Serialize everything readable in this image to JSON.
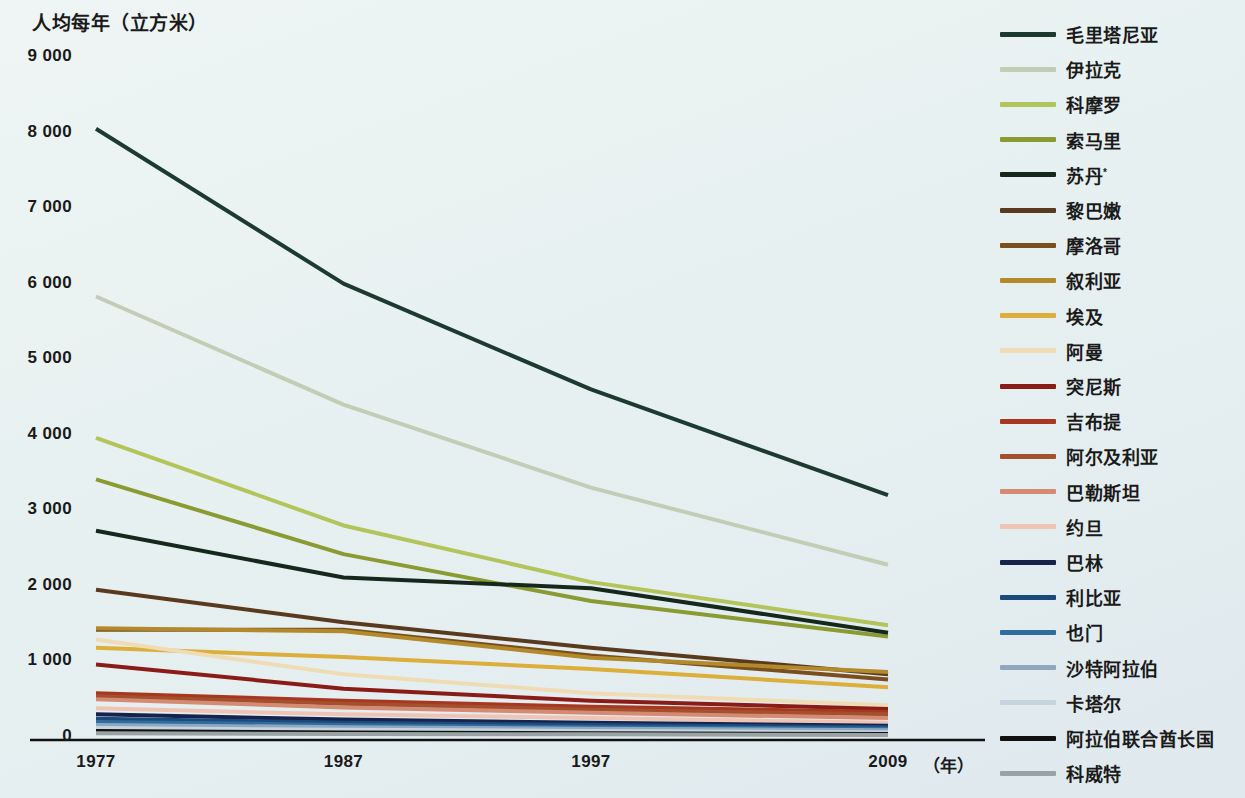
{
  "axis_title": "人均每年（立方米）",
  "x_unit_label": "（年）",
  "y_ticks": [
    "9 000",
    "8 000",
    "7 000",
    "6 000",
    "5 000",
    "4 000",
    "3 000",
    "2 000",
    "1 000",
    "0"
  ],
  "x_ticks": [
    "1977",
    "1987",
    "1997",
    "2009"
  ],
  "colors": {
    "background": "#e8f1f1",
    "axis": "#111111"
  },
  "chart_data": {
    "type": "line",
    "title": "人均每年（立方米）",
    "xlabel": "（年）",
    "ylabel": "人均每年（立方米）",
    "x": [
      1977,
      1987,
      1997,
      2009
    ],
    "xtick_labels": [
      "1977",
      "1987",
      "1997",
      "2009"
    ],
    "ytick_labels": [
      "0",
      "1 000",
      "2 000",
      "3 000",
      "4 000",
      "5 000",
      "6 000",
      "7 000",
      "8 000",
      "9 000"
    ],
    "ylim": [
      0,
      9000
    ],
    "xlim": [
      1977,
      2009
    ],
    "grid": false,
    "legend_position": "right",
    "series": [
      {
        "name": "毛里塔尼亚",
        "color": "#1d3a30",
        "values": [
          8050,
          6000,
          4600,
          3200
        ]
      },
      {
        "name": "伊拉克",
        "color": "#c3cdb6",
        "values": [
          5830,
          4400,
          3300,
          2280
        ]
      },
      {
        "name": "科摩罗",
        "color": "#b2c45a",
        "values": [
          3960,
          2800,
          2050,
          1480
        ]
      },
      {
        "name": "索马里",
        "color": "#8a9b32",
        "values": [
          3410,
          2420,
          1800,
          1330
        ]
      },
      {
        "name": "苏丹*",
        "color": "#16281c",
        "values": [
          2730,
          2110,
          1970,
          1380
        ]
      },
      {
        "name": "黎巴嫩",
        "color": "#5a3a1e",
        "values": [
          1950,
          1520,
          1180,
          830
        ]
      },
      {
        "name": "摩洛哥",
        "color": "#7a4f1d",
        "values": [
          1420,
          1420,
          1080,
          760
        ]
      },
      {
        "name": "叙利亚",
        "color": "#b38a2b",
        "values": [
          1440,
          1400,
          1050,
          860
        ]
      },
      {
        "name": "埃及",
        "color": "#dcae3a",
        "values": [
          1180,
          1060,
          900,
          660
        ]
      },
      {
        "name": "阿曼",
        "color": "#f0dcb4",
        "values": [
          1290,
          830,
          580,
          420
        ]
      },
      {
        "name": "突尼斯",
        "color": "#8a1c18",
        "values": [
          960,
          640,
          480,
          370
        ]
      },
      {
        "name": "吉布提",
        "color": "#a8371f",
        "values": [
          580,
          480,
          400,
          330
        ]
      },
      {
        "name": "阿尔及利亚",
        "color": "#a3502f",
        "values": [
          540,
          440,
          360,
          300
        ]
      },
      {
        "name": "巴勒斯坦",
        "color": "#d58b73",
        "values": [
          500,
          390,
          320,
          250
        ]
      },
      {
        "name": "约旦",
        "color": "#f0c4b4",
        "values": [
          380,
          300,
          250,
          190
        ]
      },
      {
        "name": "巴林",
        "color": "#17234c",
        "values": [
          300,
          230,
          190,
          150
        ]
      },
      {
        "name": "利比亚",
        "color": "#1c4a7a",
        "values": [
          240,
          190,
          160,
          130
        ]
      },
      {
        "name": "也门",
        "color": "#2f6d9e",
        "values": [
          200,
          160,
          130,
          110
        ]
      },
      {
        "name": "沙特阿拉伯",
        "color": "#8fa8c0",
        "values": [
          160,
          130,
          110,
          90
        ]
      },
      {
        "name": "卡塔尔",
        "color": "#c6d4df",
        "values": [
          120,
          95,
          80,
          60
        ]
      },
      {
        "name": "阿拉伯联合酋长国",
        "color": "#111111",
        "values": [
          80,
          60,
          50,
          40
        ]
      },
      {
        "name": "科威特",
        "color": "#9aa3a3",
        "values": [
          50,
          40,
          35,
          25
        ]
      }
    ]
  },
  "legend": {
    "items": [
      {
        "label": "毛里塔尼亚",
        "color": "#1d3a30"
      },
      {
        "label": "伊拉克",
        "color": "#c3cdb6"
      },
      {
        "label": "科摩罗",
        "color": "#b2c45a"
      },
      {
        "label": "索马里",
        "color": "#8a9b32"
      },
      {
        "label": "苏丹*",
        "color": "#16281c"
      },
      {
        "label": "黎巴嫩",
        "color": "#5a3a1e"
      },
      {
        "label": "摩洛哥",
        "color": "#7a4f1d"
      },
      {
        "label": "叙利亚",
        "color": "#b38a2b"
      },
      {
        "label": "埃及",
        "color": "#dcae3a"
      },
      {
        "label": "阿曼",
        "color": "#f0dcb4"
      },
      {
        "label": "突尼斯",
        "color": "#8a1c18"
      },
      {
        "label": "吉布提",
        "color": "#a8371f"
      },
      {
        "label": "阿尔及利亚",
        "color": "#a3502f"
      },
      {
        "label": "巴勒斯坦",
        "color": "#d58b73"
      },
      {
        "label": "约旦",
        "color": "#f0c4b4"
      },
      {
        "label": "巴林",
        "color": "#17234c"
      },
      {
        "label": "利比亚",
        "color": "#1c4a7a"
      },
      {
        "label": "也门",
        "color": "#2f6d9e"
      },
      {
        "label": "沙特阿拉伯",
        "color": "#8fa8c0"
      },
      {
        "label": "卡塔尔",
        "color": "#c6d4df"
      },
      {
        "label": "阿拉伯联合酋长国",
        "color": "#111111"
      },
      {
        "label": "科威特",
        "color": "#9aa3a3"
      }
    ]
  }
}
